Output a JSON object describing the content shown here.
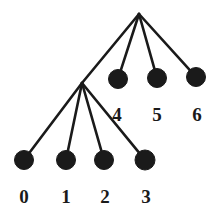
{
  "figure": {
    "kind": "tree-diagram",
    "title": "",
    "background_color": "#ffffff",
    "ink_color": "#1a1a1a",
    "width": 221,
    "height": 215
  },
  "style": {
    "edge_color": "#1a1a1a",
    "edge_width": 2.6,
    "node_fill": "#1a1a1a",
    "node_stroke": "#1a1a1a",
    "leaf_radius": 9.5,
    "label_color": "#1a1a1a",
    "label_font_size": "19px"
  },
  "nodes": [
    {
      "id": "root",
      "name": "root-node",
      "label": "",
      "x": 139,
      "y": 14,
      "r": 0,
      "type": "internal",
      "visible_dot": false
    },
    {
      "id": "internal",
      "name": "internal-node",
      "label": "",
      "x": 82,
      "y": 83,
      "r": 0,
      "type": "internal",
      "visible_dot": false
    },
    {
      "id": "leaf0",
      "name": "leaf-node-0",
      "label": "0",
      "x": 24,
      "y": 160,
      "r": 9.5,
      "type": "leaf",
      "visible_dot": true,
      "label_x": 24,
      "label_y": 187
    },
    {
      "id": "leaf1",
      "name": "leaf-node-1",
      "label": "1",
      "x": 66,
      "y": 160,
      "r": 9.5,
      "type": "leaf",
      "visible_dot": true,
      "label_x": 66,
      "label_y": 187
    },
    {
      "id": "leaf2",
      "name": "leaf-node-2",
      "label": "2",
      "x": 104,
      "y": 160,
      "r": 9.5,
      "type": "leaf",
      "visible_dot": true,
      "label_x": 105,
      "label_y": 187
    },
    {
      "id": "leaf3",
      "name": "leaf-node-3",
      "label": "3",
      "x": 145,
      "y": 160,
      "r": 10,
      "type": "leaf",
      "visible_dot": true,
      "label_x": 146,
      "label_y": 187
    },
    {
      "id": "leaf4",
      "name": "leaf-node-4",
      "label": "4",
      "x": 118,
      "y": 79,
      "r": 9.5,
      "type": "leaf",
      "visible_dot": true,
      "label_x": 117,
      "label_y": 105
    },
    {
      "id": "leaf5",
      "name": "leaf-node-5",
      "label": "5",
      "x": 157,
      "y": 78,
      "r": 9.5,
      "type": "leaf",
      "visible_dot": true,
      "label_x": 157,
      "label_y": 105
    },
    {
      "id": "leaf6",
      "name": "leaf-node-6",
      "label": "6",
      "x": 196,
      "y": 77,
      "r": 9.5,
      "type": "leaf",
      "visible_dot": true,
      "label_x": 197,
      "label_y": 105
    }
  ],
  "edges": [
    {
      "id": "e-root-internal",
      "name": "edge-root-to-internal",
      "from": "root",
      "to": "internal"
    },
    {
      "id": "e-root-leaf4",
      "name": "edge-root-to-leaf-4",
      "from": "root",
      "to": "leaf4"
    },
    {
      "id": "e-root-leaf5",
      "name": "edge-root-to-leaf-5",
      "from": "root",
      "to": "leaf5"
    },
    {
      "id": "e-root-leaf6",
      "name": "edge-root-to-leaf-6",
      "from": "root",
      "to": "leaf6"
    },
    {
      "id": "e-int-leaf0",
      "name": "edge-internal-to-leaf-0",
      "from": "internal",
      "to": "leaf0"
    },
    {
      "id": "e-int-leaf1",
      "name": "edge-internal-to-leaf-1",
      "from": "internal",
      "to": "leaf1"
    },
    {
      "id": "e-int-leaf2",
      "name": "edge-internal-to-leaf-2",
      "from": "internal",
      "to": "leaf2"
    },
    {
      "id": "e-int-leaf3",
      "name": "edge-internal-to-leaf-3",
      "from": "internal",
      "to": "leaf3"
    }
  ],
  "labels": {
    "leaf0": "0",
    "leaf1": "1",
    "leaf2": "2",
    "leaf3": "3",
    "leaf4": "4",
    "leaf5": "5",
    "leaf6": "6"
  }
}
